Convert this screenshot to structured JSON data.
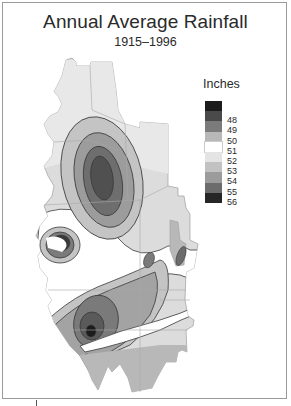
{
  "title": "Annual Average Rainfall",
  "subtitle": "1915–1996",
  "legend": {
    "title": "Inches",
    "items": [
      {
        "label": "",
        "color": "#1c1c1c"
      },
      {
        "label": "48",
        "color": "#4a4a4a"
      },
      {
        "label": "49",
        "color": "#7b7b7b"
      },
      {
        "label": "50",
        "color": "#b8b8b8"
      },
      {
        "label": "51",
        "color": "#ffffff"
      },
      {
        "label": "52",
        "color": "#e4e4e4"
      },
      {
        "label": "53",
        "color": "#c2c2c2"
      },
      {
        "label": "54",
        "color": "#9c9c9c"
      },
      {
        "label": "55",
        "color": "#6c6c6c"
      },
      {
        "label": "56",
        "color": "#262626"
      }
    ]
  },
  "colors": {
    "land_base": "#dcdcdc",
    "county_lines": "#a8a8a8",
    "contour_lines": "#3a3a3a",
    "frame": "#9a9a9a",
    "text": "#2a2a2a"
  }
}
